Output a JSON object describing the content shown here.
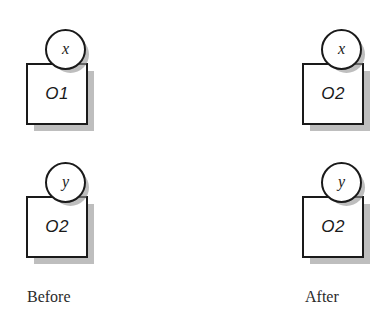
{
  "diagram": {
    "background_color": "#ffffff",
    "stroke_color": "#1a1a1a",
    "shadow_color": "#969696",
    "columns": [
      {
        "id": "before",
        "caption": "Before",
        "groups": [
          {
            "variable": "x",
            "object": "O1"
          },
          {
            "variable": "y",
            "object": "O2"
          }
        ]
      },
      {
        "id": "after",
        "caption": "After",
        "groups": [
          {
            "variable": "x",
            "object": "O2"
          },
          {
            "variable": "y",
            "object": "O2"
          }
        ]
      }
    ]
  }
}
